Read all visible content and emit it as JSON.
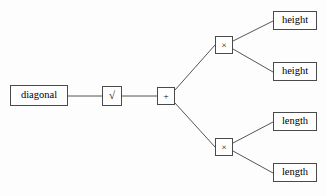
{
  "diagram": {
    "type": "expression-tree",
    "orientation": "left-to-right",
    "background_color": "#fdfdfd",
    "border_color": "#4a4a4a",
    "edge_color": "#555555",
    "text_color": "#000000",
    "nodes": {
      "root": {
        "label": "diagonal",
        "kind": "variable",
        "x": 10,
        "y": 85,
        "width": 58,
        "height": 21
      },
      "sqrt": {
        "label": "√",
        "icon": "square-root-icon",
        "kind": "operator",
        "x": 102,
        "y": 86,
        "width": 20,
        "height": 20
      },
      "plus": {
        "label": "+",
        "icon": "plus-icon",
        "kind": "operator",
        "x": 157,
        "y": 87,
        "width": 18,
        "height": 18
      },
      "times_upper": {
        "label": "×",
        "icon": "multiply-icon",
        "kind": "operator",
        "x": 215,
        "y": 36,
        "width": 18,
        "height": 18
      },
      "times_lower": {
        "label": "×",
        "icon": "multiply-icon",
        "kind": "operator",
        "x": 215,
        "y": 138,
        "width": 18,
        "height": 18
      },
      "height_1": {
        "label": "height",
        "kind": "variable",
        "x": 273,
        "y": 11,
        "width": 44,
        "height": 19
      },
      "height_2": {
        "label": "height",
        "kind": "variable",
        "x": 273,
        "y": 62,
        "width": 44,
        "height": 19
      },
      "length_1": {
        "label": "length",
        "kind": "variable",
        "x": 273,
        "y": 112,
        "width": 44,
        "height": 19
      },
      "length_2": {
        "label": "length",
        "kind": "variable",
        "x": 273,
        "y": 163,
        "width": 44,
        "height": 19
      }
    },
    "edges": [
      {
        "from": "root",
        "to": "sqrt",
        "x1": 68,
        "y1": 96,
        "x2": 102,
        "y2": 96
      },
      {
        "from": "sqrt",
        "to": "plus",
        "x1": 122,
        "y1": 96,
        "x2": 157,
        "y2": 96
      },
      {
        "from": "plus",
        "to": "times_upper",
        "x1": 175,
        "y1": 90,
        "x2": 215,
        "y2": 45
      },
      {
        "from": "plus",
        "to": "times_lower",
        "x1": 175,
        "y1": 103,
        "x2": 215,
        "y2": 147
      },
      {
        "from": "times_upper",
        "to": "height_1",
        "x1": 233,
        "y1": 41,
        "x2": 273,
        "y2": 21
      },
      {
        "from": "times_upper",
        "to": "height_2",
        "x1": 233,
        "y1": 49,
        "x2": 273,
        "y2": 72
      },
      {
        "from": "times_lower",
        "to": "length_1",
        "x1": 233,
        "y1": 143,
        "x2": 273,
        "y2": 122
      },
      {
        "from": "times_lower",
        "to": "length_2",
        "x1": 233,
        "y1": 151,
        "x2": 273,
        "y2": 173
      }
    ]
  }
}
